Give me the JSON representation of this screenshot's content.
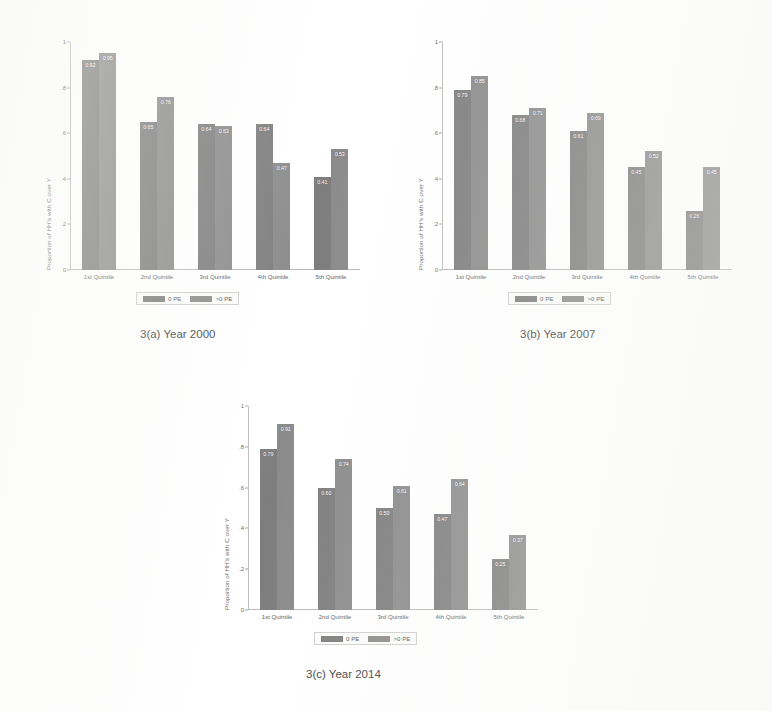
{
  "figure": {
    "series_colors": {
      "zero_pe": "#6f6f6f",
      "pos_pe": "#7e7e7e"
    },
    "y_axis_title": "Proportion of HH's with C over Y",
    "y_ticks": [
      "1",
      ".8",
      ".6",
      ".4",
      ".2",
      "0"
    ],
    "categories": [
      "1st Quintile",
      "2nd Quintile",
      "3rd Quintile",
      "4th Quintile",
      "5th Quintile"
    ],
    "legend": {
      "zero_pe_label": "0 PE",
      "pos_pe_label": ">0 PE"
    }
  },
  "chart_data": [
    {
      "type": "bar",
      "id": "chart-a",
      "title": "3(a) Year 2000",
      "caption": "3(a) Year 2000",
      "xlabel": "",
      "ylabel": "Proportion of HH's with C over Y",
      "ylim": [
        0,
        1
      ],
      "grid": false,
      "legend_position": "bottom",
      "categories": [
        "1st Quintile",
        "2nd Quintile",
        "3rd Quintile",
        "4th Quintile",
        "5th Quintile"
      ],
      "series": [
        {
          "name": "0 PE",
          "values": [
            0.92,
            0.65,
            0.64,
            0.64,
            0.41
          ]
        },
        {
          "name": ">0 PE",
          "values": [
            0.95,
            0.76,
            0.63,
            0.47,
            0.53
          ]
        }
      ]
    },
    {
      "type": "bar",
      "id": "chart-b",
      "title": "3(b) Year 2007",
      "caption": "3(b) Year 2007",
      "xlabel": "",
      "ylabel": "Proportion of HH's with C over Y",
      "ylim": [
        0,
        1
      ],
      "grid": false,
      "legend_position": "bottom",
      "categories": [
        "1st Quintile",
        "2nd Quintile",
        "3rd Quintile",
        "4th Quintile",
        "5th Quintile"
      ],
      "series": [
        {
          "name": "0 PE",
          "values": [
            0.79,
            0.68,
            0.61,
            0.45,
            0.26
          ]
        },
        {
          "name": ">0 PE",
          "values": [
            0.85,
            0.71,
            0.69,
            0.52,
            0.45
          ]
        }
      ]
    },
    {
      "type": "bar",
      "id": "chart-c",
      "title": "3(c) Year 2014",
      "caption": "3(c) Year 2014",
      "xlabel": "",
      "ylabel": "Proportion of HH's with C over Y",
      "ylim": [
        0,
        1
      ],
      "grid": false,
      "legend_position": "bottom",
      "categories": [
        "1st Quintile",
        "2nd Quintile",
        "3rd Quintile",
        "4th Quintile",
        "5th Quintile"
      ],
      "series": [
        {
          "name": "0 PE",
          "values": [
            0.79,
            0.6,
            0.5,
            0.47,
            0.25
          ]
        },
        {
          "name": ">0 PE",
          "values": [
            0.91,
            0.74,
            0.61,
            0.64,
            0.37
          ]
        }
      ]
    }
  ]
}
